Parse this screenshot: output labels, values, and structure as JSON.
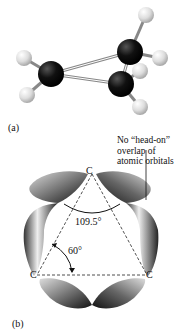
{
  "panel_a": {
    "label": "(a)",
    "description": "ball-and-stick model of cyclopropane"
  },
  "panel_b": {
    "label": "(b)",
    "atoms": [
      "C",
      "C",
      "C"
    ],
    "annotation": {
      "line1": "No “head-on”",
      "line2": "overlap of",
      "line3": "atomic orbitals"
    },
    "angle_tetrahedral": "109.5°",
    "angle_ring": "60°"
  }
}
